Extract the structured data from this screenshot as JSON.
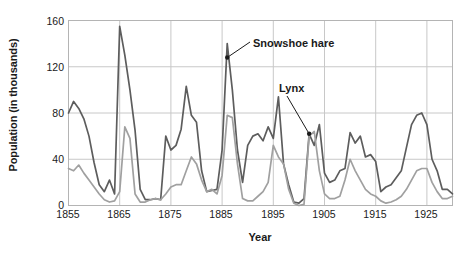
{
  "chart_data": {
    "type": "line",
    "title": "",
    "xlabel": "Year",
    "ylabel": "Population (in thousands)",
    "xlim": [
      1855,
      1930
    ],
    "ylim": [
      0,
      160
    ],
    "grid": true,
    "legend_position": "inline-annotation",
    "xticks": [
      1855,
      1865,
      1875,
      1885,
      1895,
      1905,
      1915,
      1925
    ],
    "yticks": [
      0,
      40,
      80,
      120,
      160
    ],
    "annotations": [
      {
        "text": "Snowshoe hare",
        "points_to_series": "Snowshoe hare",
        "points_to_x": 1886,
        "points_to_y": 128
      },
      {
        "text": "Lynx",
        "points_to_series": "Lynx",
        "points_to_x": 1902,
        "points_to_y": 62
      }
    ],
    "x": [
      1855,
      1856,
      1857,
      1858,
      1859,
      1860,
      1861,
      1862,
      1863,
      1864,
      1865,
      1866,
      1867,
      1868,
      1869,
      1870,
      1871,
      1872,
      1873,
      1874,
      1875,
      1876,
      1877,
      1878,
      1879,
      1880,
      1881,
      1882,
      1883,
      1884,
      1885,
      1886,
      1887,
      1888,
      1889,
      1890,
      1891,
      1892,
      1893,
      1894,
      1895,
      1896,
      1897,
      1898,
      1899,
      1900,
      1901,
      1902,
      1903,
      1904,
      1905,
      1906,
      1907,
      1908,
      1909,
      1910,
      1911,
      1912,
      1913,
      1914,
      1915,
      1916,
      1917,
      1918,
      1919,
      1920,
      1921,
      1922,
      1923,
      1924,
      1925,
      1926,
      1927,
      1928,
      1929,
      1930
    ],
    "series": [
      {
        "name": "Snowshoe hare",
        "color": "#5d5d5d",
        "values": [
          80,
          90,
          84,
          75,
          60,
          37,
          18,
          12,
          22,
          10,
          155,
          130,
          100,
          65,
          14,
          5,
          5,
          6,
          5,
          60,
          48,
          52,
          66,
          103,
          78,
          72,
          30,
          12,
          13,
          14,
          48,
          140,
          100,
          48,
          20,
          52,
          60,
          62,
          56,
          68,
          58,
          94,
          36,
          18,
          3,
          2,
          6,
          62,
          52,
          70,
          28,
          20,
          22,
          30,
          32,
          63,
          54,
          60,
          42,
          44,
          38,
          12,
          16,
          18,
          24,
          30,
          50,
          70,
          78,
          80,
          70,
          40,
          30,
          14,
          14,
          10
        ]
      },
      {
        "name": "Lynx",
        "color": "#a0a0a0",
        "values": [
          32,
          30,
          35,
          28,
          22,
          16,
          10,
          5,
          3,
          4,
          12,
          68,
          58,
          10,
          3,
          3,
          5,
          6,
          5,
          10,
          16,
          18,
          18,
          30,
          42,
          36,
          22,
          12,
          14,
          10,
          26,
          78,
          76,
          36,
          6,
          4,
          4,
          8,
          12,
          20,
          52,
          42,
          36,
          14,
          2,
          0,
          1,
          60,
          64,
          30,
          10,
          6,
          6,
          8,
          22,
          40,
          30,
          22,
          14,
          10,
          8,
          4,
          2,
          3,
          5,
          8,
          14,
          22,
          30,
          32,
          32,
          20,
          12,
          6,
          6,
          8
        ]
      }
    ]
  },
  "axes": {
    "y_tick_labels": [
      "160",
      "120",
      "80",
      "40",
      "0"
    ],
    "x_tick_labels": [
      "1855",
      "1865",
      "1875",
      "1885",
      "1895",
      "1905",
      "1915",
      "1925"
    ],
    "x_axis_title": "Year",
    "y_axis_title": "Population (in thousands)"
  },
  "labels": {
    "hare": "Snowshoe hare",
    "lynx": "Lynx"
  },
  "colors": {
    "hare_line": "#5d5d5d",
    "lynx_line": "#a0a0a0",
    "grid": "#c8c8c8",
    "frame": "#b4b4b4",
    "text": "#1a1a1a"
  }
}
